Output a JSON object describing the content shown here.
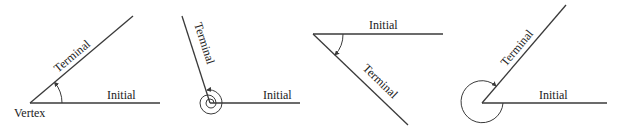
{
  "figure": {
    "diagrams": [
      {
        "id": "acute-positive",
        "labels": {
          "initial": "Initial",
          "terminal": "Terminal",
          "vertex": "Vertex"
        },
        "rotation": "counterclockwise"
      },
      {
        "id": "multi-revolution",
        "labels": {
          "initial": "Initial",
          "terminal": "Terminal"
        },
        "rotation": "counterclockwise (multiple revolutions)"
      },
      {
        "id": "negative-clockwise",
        "labels": {
          "initial": "Initial",
          "terminal": "Terminal"
        },
        "rotation": "clockwise"
      },
      {
        "id": "reflex-angle",
        "labels": {
          "initial": "Initial",
          "terminal": "Terminal"
        },
        "rotation": "counterclockwise (reflex)"
      }
    ],
    "colors": {
      "line": "#3a3a3a",
      "text": "#222222",
      "background": "#ffffff"
    }
  }
}
